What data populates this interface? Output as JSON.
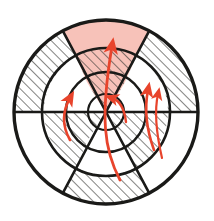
{
  "figure": {
    "title": "Hatched concentric sector disc with radial flow arrows",
    "type": "technical-diagram",
    "background_color": "#ffffff",
    "line_color": "#1a1a18",
    "hatch_color": "#3a3a36",
    "highlight_fill": "#f7c2b9",
    "arrow_color": "#e8442c",
    "canvas": {
      "width": 214,
      "height": 221
    }
  },
  "geometry": {
    "center": {
      "x": 106,
      "y": 112
    },
    "radii": {
      "outer": 92,
      "ring2": 64,
      "ring1": 40,
      "core": 18
    },
    "ring_labels": [
      "core",
      "ring1",
      "ring2",
      "outer"
    ],
    "spoke_angles_deg": [
      0,
      62,
      118,
      180,
      242,
      298
    ],
    "spoke_count": 6,
    "diameter_line": "horizontal"
  },
  "highlight": {
    "label": "shaded-wedge",
    "fill": "#f7c2b9",
    "start_angle_deg": 118,
    "end_angle_deg": 62,
    "description": "upper sector shaded from core to outer rim"
  },
  "cells": [
    {
      "id": "outer-upper-left",
      "ring": "outer",
      "fill": "hatch"
    },
    {
      "id": "outer-top",
      "ring": "outer",
      "fill": "highlight"
    },
    {
      "id": "outer-upper-right",
      "ring": "outer",
      "fill": "hatch"
    },
    {
      "id": "outer-lower-right",
      "ring": "outer",
      "fill": "white"
    },
    {
      "id": "outer-bottom",
      "ring": "outer",
      "fill": "hatch"
    },
    {
      "id": "outer-lower-left",
      "ring": "outer",
      "fill": "white"
    },
    {
      "id": "ring2-upper-left",
      "ring": "ring2",
      "fill": "highlight"
    },
    {
      "id": "ring2-top",
      "ring": "ring2",
      "fill": "hatch-highlight"
    },
    {
      "id": "ring2-upper-right",
      "ring": "ring2",
      "fill": "highlight"
    },
    {
      "id": "ring2-lower-right",
      "ring": "ring2",
      "fill": "hatch"
    },
    {
      "id": "ring2-bottom",
      "ring": "ring2",
      "fill": "white"
    },
    {
      "id": "ring2-lower-left",
      "ring": "ring2",
      "fill": "hatch"
    },
    {
      "id": "ring1-upper-left",
      "ring": "ring1",
      "fill": "highlight"
    },
    {
      "id": "ring1-top",
      "ring": "ring1",
      "fill": "hatch-highlight"
    },
    {
      "id": "ring1-upper-right",
      "ring": "ring1",
      "fill": "highlight"
    },
    {
      "id": "ring1-lower-right",
      "ring": "ring1",
      "fill": "hatch"
    },
    {
      "id": "ring1-bottom",
      "ring": "ring1",
      "fill": "white"
    },
    {
      "id": "ring1-lower-left",
      "ring": "ring1",
      "fill": "hatch"
    },
    {
      "id": "core-upper-left",
      "ring": "core",
      "fill": "highlight"
    },
    {
      "id": "core-top",
      "ring": "core",
      "fill": "hatch-highlight"
    },
    {
      "id": "core-upper-right",
      "ring": "core",
      "fill": "highlight"
    },
    {
      "id": "core-lower-right",
      "ring": "core",
      "fill": "hatch"
    },
    {
      "id": "core-bottom",
      "ring": "core",
      "fill": "white"
    },
    {
      "id": "core-lower-left",
      "ring": "core",
      "fill": "hatch"
    }
  ],
  "arrows": [
    {
      "id": "arrow-left",
      "color": "#e8442c",
      "direction": "outward-up",
      "length": "long"
    },
    {
      "id": "arrow-center-top",
      "color": "#e8442c",
      "direction": "outward-up",
      "length": "long"
    },
    {
      "id": "arrow-right-inner",
      "color": "#e8442c",
      "direction": "outward-up",
      "length": "medium"
    },
    {
      "id": "arrow-right-outer",
      "color": "#e8442c",
      "direction": "outward-up",
      "length": "long"
    },
    {
      "id": "arrow-core",
      "color": "#e8442c",
      "direction": "inward-curl",
      "length": "short"
    }
  ]
}
